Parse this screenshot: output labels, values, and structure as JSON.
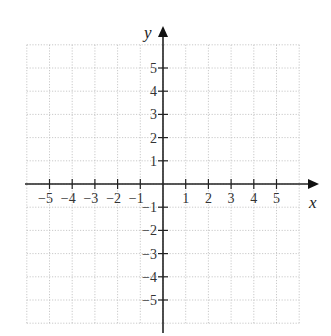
{
  "chart_data": {
    "type": "scatter",
    "title": "",
    "xlabel": "x",
    "ylabel": "y",
    "xlim": [
      -6,
      6
    ],
    "ylim": [
      -6,
      6
    ],
    "grid": true,
    "grid_style": "dotted",
    "x_ticks": [
      -5,
      -4,
      -3,
      -2,
      -1,
      1,
      2,
      3,
      4,
      5
    ],
    "y_ticks": [
      -5,
      -4,
      -3,
      -2,
      -1,
      1,
      2,
      3,
      4,
      5
    ],
    "x_tick_labels": [
      "−5",
      "−4",
      "−3",
      "−2",
      "−1",
      "1",
      "2",
      "3",
      "4",
      "5"
    ],
    "y_tick_labels": [
      "−5",
      "−4",
      "−3",
      "−2",
      "−1",
      "1",
      "2",
      "3",
      "4",
      "5"
    ],
    "series": [],
    "legend": null
  },
  "colors": {
    "axis": "#222222",
    "grid": "#bbbbbb",
    "tick_label": "#333333"
  }
}
